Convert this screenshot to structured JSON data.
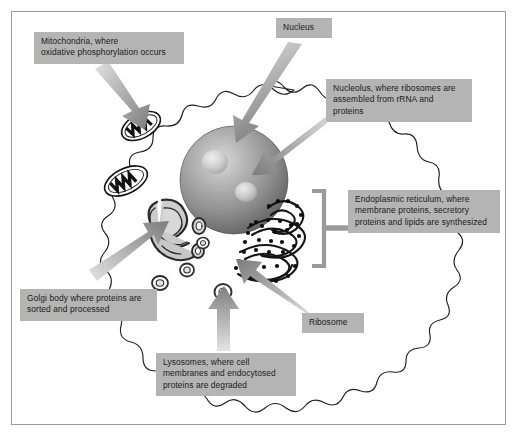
{
  "figure": {
    "frame_color": "#9a9a9a",
    "background": "#ffffff",
    "label_box_color": "#b4b4b4",
    "label_text_color": "#1a1a1a",
    "arrow_color": "#8c8c8c",
    "membrane_color": "#1a1a1a"
  },
  "labels": {
    "mitochondria": "Mitochondria, where\noxidative phosphorylation occurs",
    "nucleus": "Nucleus",
    "nucleolus": "Nucleolus, where ribosomes are\nassembled from rRNA and\nproteins",
    "endoplasmic_reticulum": "Endoplasmic reticulum, where\nmembrane proteins, secretory\nproteins and lipids are synthesized",
    "golgi": "Golgi body where proteins are\nsorted and processed",
    "lysosomes": "Lysosomes, where cell\nmembranes and endocytosed\nproteins are degraded",
    "ribosome": "Ribosome"
  },
  "structures": [
    {
      "name": "plasma-membrane",
      "count": 1,
      "description": "wavy outer cell boundary"
    },
    {
      "name": "nucleus",
      "count": 1,
      "description": "large shaded sphere at center"
    },
    {
      "name": "nucleolus",
      "count": 2,
      "description": "lighter spherical bodies inside nucleus"
    },
    {
      "name": "mitochondrion",
      "count": 2,
      "description": "ovals with dark cristae"
    },
    {
      "name": "golgi-body",
      "count": 1,
      "description": "stacked curved cisternae, left of nucleus"
    },
    {
      "name": "rough-endoplasmic-reticulum",
      "count": 1,
      "description": "folded membranes studded with ribosomes, right of nucleus"
    },
    {
      "name": "lysosome",
      "count": 4,
      "description": "small double-outlined vesicles"
    }
  ],
  "connectors": [
    {
      "from": "mitochondria",
      "type": "arrow"
    },
    {
      "from": "nucleus",
      "type": "arrow"
    },
    {
      "from": "nucleolus",
      "type": "arrow"
    },
    {
      "from": "endoplasmic_reticulum",
      "type": "bracket"
    },
    {
      "from": "golgi",
      "type": "arrow"
    },
    {
      "from": "lysosomes",
      "type": "arrow"
    },
    {
      "from": "ribosome",
      "type": "arrow"
    }
  ]
}
